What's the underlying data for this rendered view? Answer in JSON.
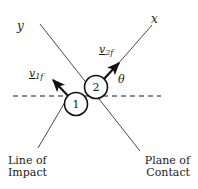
{
  "figure": {
    "type": "physics-collision-diagram",
    "background_color": "#ffffff",
    "stroke_color": "#1a1a1a"
  },
  "axes": {
    "y_label": "y",
    "x_label": "x"
  },
  "bodies": [
    {
      "id": "body-1",
      "label": "1",
      "cx": 76,
      "cy": 104,
      "r": 11.5
    },
    {
      "id": "body-2",
      "label": "2",
      "cx": 96,
      "cy": 87,
      "r": 11.5
    }
  ],
  "vectors": [
    {
      "id": "v1f",
      "symbol": "v",
      "subscript": "1f",
      "underlined": true,
      "from": [
        70,
        98
      ],
      "to": [
        51,
        78
      ]
    },
    {
      "id": "v2f",
      "symbol": "v",
      "subscript": "2f",
      "underlined": true,
      "from": [
        102,
        81
      ],
      "to": [
        121,
        61
      ]
    }
  ],
  "angle": {
    "symbol": "θ",
    "name": "theta",
    "vertex": [
      104,
      80
    ]
  },
  "lines": {
    "plane_of_contact": {
      "style": "dashed",
      "from": [
        13,
        96
      ],
      "to": [
        161,
        96
      ]
    },
    "line_of_impact": {
      "style": "solid",
      "from": [
        40,
        24
      ],
      "to": [
        140,
        151
      ]
    },
    "x_axis": {
      "style": "solid",
      "from": [
        104,
        80
      ],
      "to": [
        152,
        25
      ]
    },
    "y_axis_lower": {
      "style": "solid",
      "from": [
        68,
        97
      ],
      "to": [
        38,
        148
      ]
    }
  },
  "captions": {
    "left": {
      "line1": "Line of",
      "line2": "Impact"
    },
    "right": {
      "line1": "Plane of",
      "line2": "Contact"
    }
  }
}
